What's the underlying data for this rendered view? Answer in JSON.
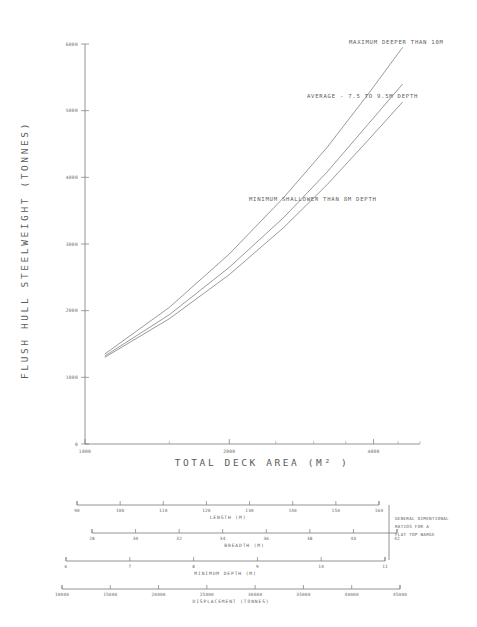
{
  "chart_data": {
    "type": "line",
    "title": "",
    "xlabel": "TOTAL DECK AREA (M² )",
    "ylabel": "FLUSH HULL STEELWEIGHT (TONNES)",
    "xscale": "log",
    "yscale": "linear",
    "xlim": [
      1000,
      5000
    ],
    "ylim": [
      0,
      6000
    ],
    "grid": false,
    "legend_position": "inline-annotation",
    "xticks": [
      1000,
      2000,
      4000
    ],
    "xtick_labels": [
      "1000",
      "2000",
      "4000"
    ],
    "xminor_ticks": [
      1500,
      2500,
      3000,
      3500,
      4500,
      5000
    ],
    "yticks": [
      0,
      1000,
      2000,
      3000,
      4000,
      5000,
      6000
    ],
    "ytick_labels": [
      "0",
      "1000",
      "2000",
      "3000",
      "4000",
      "5000",
      "6000"
    ],
    "series": [
      {
        "name": "MAXIMUM DEEPER THAN 10M",
        "annotation": "MAXIMUM DEEPER THAN 10M",
        "x": [
          1100,
          1500,
          2000,
          2600,
          3200,
          3900,
          4600
        ],
        "y": [
          1350,
          2050,
          2850,
          3700,
          4450,
          5250,
          5950
        ]
      },
      {
        "name": "AVERAGE - 7.5 TO 9.5M DEPTH",
        "annotation": "AVERAGE - 7.5 TO 9.5M DEPTH",
        "x": [
          1100,
          1500,
          2000,
          2600,
          3200,
          3900,
          4600
        ],
        "y": [
          1320,
          1940,
          2650,
          3400,
          4080,
          4800,
          5400
        ]
      },
      {
        "name": "MINIMUM SHALLOWER THAN 8M DEPTH",
        "annotation": "MINIMUM SHALLOWER THAN 8M DEPTH",
        "x": [
          1100,
          1500,
          2000,
          2600,
          3200,
          3900,
          4600
        ],
        "y": [
          1300,
          1880,
          2540,
          3250,
          3890,
          4560,
          5130
        ]
      }
    ],
    "annotations": [
      {
        "text": "MAXIMUM DEEPER THAN 10M",
        "x_px": 349,
        "y_px": 44
      },
      {
        "text": "AVERAGE - 7.5 TO 9.5M DEPTH",
        "x_px": 307,
        "y_px": 98
      },
      {
        "text": "MINIMUM SHALLOWER THAN 8M DEPTH",
        "x_px": 249,
        "y_px": 201
      }
    ]
  },
  "nomogram": {
    "note": {
      "line1": "GENERAL DIMENTIONAL",
      "line2": "RATIOS FOR A",
      "line3": "FLAT TOP BARGE"
    },
    "scales": [
      {
        "title": "LENGTH (M)",
        "ticks": [
          90,
          100,
          110,
          120,
          130,
          140,
          150,
          160
        ],
        "tick_labels": [
          "90",
          "100",
          "110",
          "120",
          "130",
          "140",
          "150",
          "160"
        ],
        "min": 90,
        "max": 160
      },
      {
        "title": "BREADTH (M)",
        "ticks": [
          28,
          30,
          32,
          34,
          36,
          38,
          40,
          42
        ],
        "tick_labels": [
          "28",
          "30",
          "32",
          "34",
          "36",
          "38",
          "40",
          "42"
        ],
        "min": 28,
        "max": 42
      },
      {
        "title": "MINIMUM DEPTH (M)",
        "ticks": [
          6,
          7,
          8,
          9,
          10,
          11
        ],
        "tick_labels": [
          "6",
          "7",
          "8",
          "9",
          "10",
          "11"
        ],
        "min": 6,
        "max": 11
      },
      {
        "title": "DISPLACEMENT (TONNES)",
        "ticks": [
          10000,
          15000,
          20000,
          25000,
          30000,
          35000,
          40000,
          45000
        ],
        "tick_labels": [
          "10000",
          "15000",
          "20000",
          "25000",
          "30000",
          "35000",
          "40000",
          "45000"
        ],
        "min": 10000,
        "max": 45000
      }
    ]
  }
}
